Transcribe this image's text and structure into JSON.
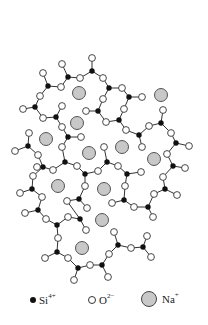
{
  "figure": {
    "colors": {
      "si": "#111111",
      "o_fill": "#ffffff",
      "o_stroke": "#333333",
      "na_fill": "#c8c8c8",
      "na_stroke": "#444444",
      "bond": "#333333"
    }
  },
  "legend": {
    "items": [
      {
        "symbol": "Si",
        "charge": "4+",
        "kind": "si"
      },
      {
        "symbol": "O",
        "charge": "2−",
        "kind": "o"
      },
      {
        "symbol": "Na",
        "charge": "+",
        "kind": "na"
      }
    ]
  },
  "atoms": {
    "si": [
      [
        92,
        71
      ],
      [
        68,
        77
      ],
      [
        48,
        86
      ],
      [
        109,
        88
      ],
      [
        129,
        97
      ],
      [
        35,
        107
      ],
      [
        56,
        117
      ],
      [
        98,
        111
      ],
      [
        119,
        120
      ],
      [
        68,
        137
      ],
      [
        139,
        135
      ],
      [
        161,
        123
      ],
      [
        176,
        143
      ],
      [
        28,
        146
      ],
      [
        65,
        162
      ],
      [
        43,
        167
      ],
      [
        85,
        174
      ],
      [
        107,
        162
      ],
      [
        127,
        174
      ],
      [
        32,
        189
      ],
      [
        38,
        210
      ],
      [
        79,
        199
      ],
      [
        124,
        200
      ],
      [
        148,
        207
      ],
      [
        165,
        189
      ],
      [
        173,
        166
      ],
      [
        57,
        225
      ],
      [
        80,
        219
      ],
      [
        57,
        252
      ],
      [
        78,
        268
      ],
      [
        102,
        265
      ],
      [
        118,
        245
      ],
      [
        143,
        247
      ]
    ],
    "o": [
      [
        92,
        58
      ],
      [
        62,
        64
      ],
      [
        80,
        78
      ],
      [
        43,
        73
      ],
      [
        61,
        87
      ],
      [
        103,
        78
      ],
      [
        122,
        88
      ],
      [
        142,
        97
      ],
      [
        40,
        96
      ],
      [
        23,
        109
      ],
      [
        62,
        106
      ],
      [
        43,
        118
      ],
      [
        103,
        99
      ],
      [
        86,
        111
      ],
      [
        124,
        109
      ],
      [
        106,
        122
      ],
      [
        62,
        127
      ],
      [
        81,
        137
      ],
      [
        126,
        130
      ],
      [
        149,
        126
      ],
      [
        163,
        110
      ],
      [
        171,
        133
      ],
      [
        189,
        146
      ],
      [
        142,
        147
      ],
      [
        29,
        133
      ],
      [
        15,
        151
      ],
      [
        38,
        155
      ],
      [
        62,
        147
      ],
      [
        104,
        147
      ],
      [
        53,
        170
      ],
      [
        77,
        166
      ],
      [
        98,
        171
      ],
      [
        118,
        166
      ],
      [
        141,
        172
      ],
      [
        125,
        186
      ],
      [
        37,
        167
      ],
      [
        33,
        176
      ],
      [
        20,
        193
      ],
      [
        42,
        197
      ],
      [
        25,
        213
      ],
      [
        85,
        186
      ],
      [
        67,
        201
      ],
      [
        87,
        208
      ],
      [
        112,
        203
      ],
      [
        134,
        207
      ],
      [
        153,
        217
      ],
      [
        154,
        194
      ],
      [
        177,
        195
      ],
      [
        163,
        177
      ],
      [
        185,
        168
      ],
      [
        167,
        154
      ],
      [
        46,
        219
      ],
      [
        68,
        217
      ],
      [
        86,
        230
      ],
      [
        58,
        238
      ],
      [
        45,
        258
      ],
      [
        68,
        258
      ],
      [
        74,
        280
      ],
      [
        90,
        265
      ],
      [
        108,
        277
      ],
      [
        109,
        254
      ],
      [
        114,
        232
      ],
      [
        131,
        248
      ],
      [
        151,
        257
      ],
      [
        147,
        236
      ]
    ],
    "na": [
      [
        79,
        93
      ],
      [
        161,
        95
      ],
      [
        77,
        123
      ],
      [
        46,
        139
      ],
      [
        89,
        153
      ],
      [
        122,
        147
      ],
      [
        154,
        159
      ],
      [
        58,
        186
      ],
      [
        104,
        189
      ],
      [
        102,
        220
      ],
      [
        82,
        248
      ]
    ]
  },
  "bonds": [
    [
      [
        92,
        58
      ],
      [
        92,
        71
      ]
    ],
    [
      [
        92,
        71
      ],
      [
        80,
        78
      ]
    ],
    [
      [
        92,
        71
      ],
      [
        103,
        78
      ]
    ],
    [
      [
        62,
        64
      ],
      [
        68,
        77
      ]
    ],
    [
      [
        68,
        77
      ],
      [
        80,
        78
      ]
    ],
    [
      [
        68,
        77
      ],
      [
        61,
        87
      ]
    ],
    [
      [
        43,
        73
      ],
      [
        48,
        86
      ]
    ],
    [
      [
        48,
        86
      ],
      [
        61,
        87
      ]
    ],
    [
      [
        48,
        86
      ],
      [
        40,
        96
      ]
    ],
    [
      [
        103,
        78
      ],
      [
        109,
        88
      ]
    ],
    [
      [
        109,
        88
      ],
      [
        122,
        88
      ]
    ],
    [
      [
        109,
        88
      ],
      [
        103,
        99
      ]
    ],
    [
      [
        122,
        88
      ],
      [
        129,
        97
      ]
    ],
    [
      [
        129,
        97
      ],
      [
        142,
        97
      ]
    ],
    [
      [
        129,
        97
      ],
      [
        124,
        109
      ]
    ],
    [
      [
        40,
        96
      ],
      [
        35,
        107
      ]
    ],
    [
      [
        35,
        107
      ],
      [
        23,
        109
      ]
    ],
    [
      [
        35,
        107
      ],
      [
        43,
        118
      ]
    ],
    [
      [
        62,
        106
      ],
      [
        56,
        117
      ]
    ],
    [
      [
        56,
        117
      ],
      [
        43,
        118
      ]
    ],
    [
      [
        56,
        117
      ],
      [
        62,
        127
      ]
    ],
    [
      [
        103,
        99
      ],
      [
        98,
        111
      ]
    ],
    [
      [
        98,
        111
      ],
      [
        86,
        111
      ]
    ],
    [
      [
        98,
        111
      ],
      [
        106,
        122
      ]
    ],
    [
      [
        124,
        109
      ],
      [
        119,
        120
      ]
    ],
    [
      [
        119,
        120
      ],
      [
        106,
        122
      ]
    ],
    [
      [
        119,
        120
      ],
      [
        126,
        130
      ]
    ],
    [
      [
        62,
        127
      ],
      [
        68,
        137
      ]
    ],
    [
      [
        68,
        137
      ],
      [
        81,
        137
      ]
    ],
    [
      [
        68,
        137
      ],
      [
        62,
        147
      ]
    ],
    [
      [
        126,
        130
      ],
      [
        139,
        135
      ]
    ],
    [
      [
        139,
        135
      ],
      [
        149,
        126
      ]
    ],
    [
      [
        139,
        135
      ],
      [
        142,
        147
      ]
    ],
    [
      [
        149,
        126
      ],
      [
        161,
        123
      ]
    ],
    [
      [
        161,
        123
      ],
      [
        163,
        110
      ]
    ],
    [
      [
        161,
        123
      ],
      [
        171,
        133
      ]
    ],
    [
      [
        171,
        133
      ],
      [
        176,
        143
      ]
    ],
    [
      [
        176,
        143
      ],
      [
        189,
        146
      ]
    ],
    [
      [
        176,
        143
      ],
      [
        167,
        154
      ]
    ],
    [
      [
        29,
        133
      ],
      [
        28,
        146
      ]
    ],
    [
      [
        28,
        146
      ],
      [
        15,
        151
      ]
    ],
    [
      [
        28,
        146
      ],
      [
        38,
        155
      ]
    ],
    [
      [
        62,
        147
      ],
      [
        65,
        162
      ]
    ],
    [
      [
        65,
        162
      ],
      [
        53,
        170
      ]
    ],
    [
      [
        65,
        162
      ],
      [
        77,
        166
      ]
    ],
    [
      [
        38,
        155
      ],
      [
        43,
        167
      ]
    ],
    [
      [
        43,
        167
      ],
      [
        53,
        170
      ]
    ],
    [
      [
        43,
        167
      ],
      [
        37,
        167
      ]
    ],
    [
      [
        43,
        167
      ],
      [
        33,
        176
      ]
    ],
    [
      [
        77,
        166
      ],
      [
        85,
        174
      ]
    ],
    [
      [
        85,
        174
      ],
      [
        98,
        171
      ]
    ],
    [
      [
        85,
        174
      ],
      [
        85,
        186
      ]
    ],
    [
      [
        104,
        147
      ],
      [
        107,
        162
      ]
    ],
    [
      [
        107,
        162
      ],
      [
        98,
        171
      ]
    ],
    [
      [
        107,
        162
      ],
      [
        118,
        166
      ]
    ],
    [
      [
        118,
        166
      ],
      [
        127,
        174
      ]
    ],
    [
      [
        127,
        174
      ],
      [
        141,
        172
      ]
    ],
    [
      [
        127,
        174
      ],
      [
        125,
        186
      ]
    ],
    [
      [
        33,
        176
      ],
      [
        32,
        189
      ]
    ],
    [
      [
        32,
        189
      ],
      [
        20,
        193
      ]
    ],
    [
      [
        32,
        189
      ],
      [
        42,
        197
      ]
    ],
    [
      [
        42,
        197
      ],
      [
        38,
        210
      ]
    ],
    [
      [
        38,
        210
      ],
      [
        25,
        213
      ]
    ],
    [
      [
        38,
        210
      ],
      [
        46,
        219
      ]
    ],
    [
      [
        85,
        186
      ],
      [
        79,
        199
      ]
    ],
    [
      [
        79,
        199
      ],
      [
        67,
        201
      ]
    ],
    [
      [
        79,
        199
      ],
      [
        87,
        208
      ]
    ],
    [
      [
        125,
        186
      ],
      [
        124,
        200
      ]
    ],
    [
      [
        124,
        200
      ],
      [
        112,
        203
      ]
    ],
    [
      [
        124,
        200
      ],
      [
        134,
        207
      ]
    ],
    [
      [
        134,
        207
      ],
      [
        148,
        207
      ]
    ],
    [
      [
        148,
        207
      ],
      [
        153,
        217
      ]
    ],
    [
      [
        148,
        207
      ],
      [
        154,
        194
      ]
    ],
    [
      [
        154,
        194
      ],
      [
        165,
        189
      ]
    ],
    [
      [
        165,
        189
      ],
      [
        177,
        195
      ]
    ],
    [
      [
        165,
        189
      ],
      [
        163,
        177
      ]
    ],
    [
      [
        163,
        177
      ],
      [
        173,
        166
      ]
    ],
    [
      [
        173,
        166
      ],
      [
        185,
        168
      ]
    ],
    [
      [
        173,
        166
      ],
      [
        167,
        154
      ]
    ],
    [
      [
        46,
        219
      ],
      [
        57,
        225
      ]
    ],
    [
      [
        57,
        225
      ],
      [
        68,
        217
      ]
    ],
    [
      [
        57,
        225
      ],
      [
        58,
        238
      ]
    ],
    [
      [
        68,
        217
      ],
      [
        80,
        219
      ]
    ],
    [
      [
        80,
        219
      ],
      [
        67,
        201
      ]
    ],
    [
      [
        80,
        219
      ],
      [
        86,
        230
      ]
    ],
    [
      [
        58,
        238
      ],
      [
        57,
        252
      ]
    ],
    [
      [
        57,
        252
      ],
      [
        45,
        258
      ]
    ],
    [
      [
        57,
        252
      ],
      [
        68,
        258
      ]
    ],
    [
      [
        68,
        258
      ],
      [
        78,
        268
      ]
    ],
    [
      [
        78,
        268
      ],
      [
        74,
        280
      ]
    ],
    [
      [
        78,
        268
      ],
      [
        90,
        265
      ]
    ],
    [
      [
        90,
        265
      ],
      [
        102,
        265
      ]
    ],
    [
      [
        102,
        265
      ],
      [
        108,
        277
      ]
    ],
    [
      [
        102,
        265
      ],
      [
        109,
        254
      ]
    ],
    [
      [
        109,
        254
      ],
      [
        118,
        245
      ]
    ],
    [
      [
        118,
        245
      ],
      [
        114,
        232
      ]
    ],
    [
      [
        118,
        245
      ],
      [
        131,
        248
      ]
    ],
    [
      [
        131,
        248
      ],
      [
        143,
        247
      ]
    ],
    [
      [
        143,
        247
      ],
      [
        151,
        257
      ]
    ],
    [
      [
        143,
        247
      ],
      [
        147,
        236
      ]
    ]
  ]
}
